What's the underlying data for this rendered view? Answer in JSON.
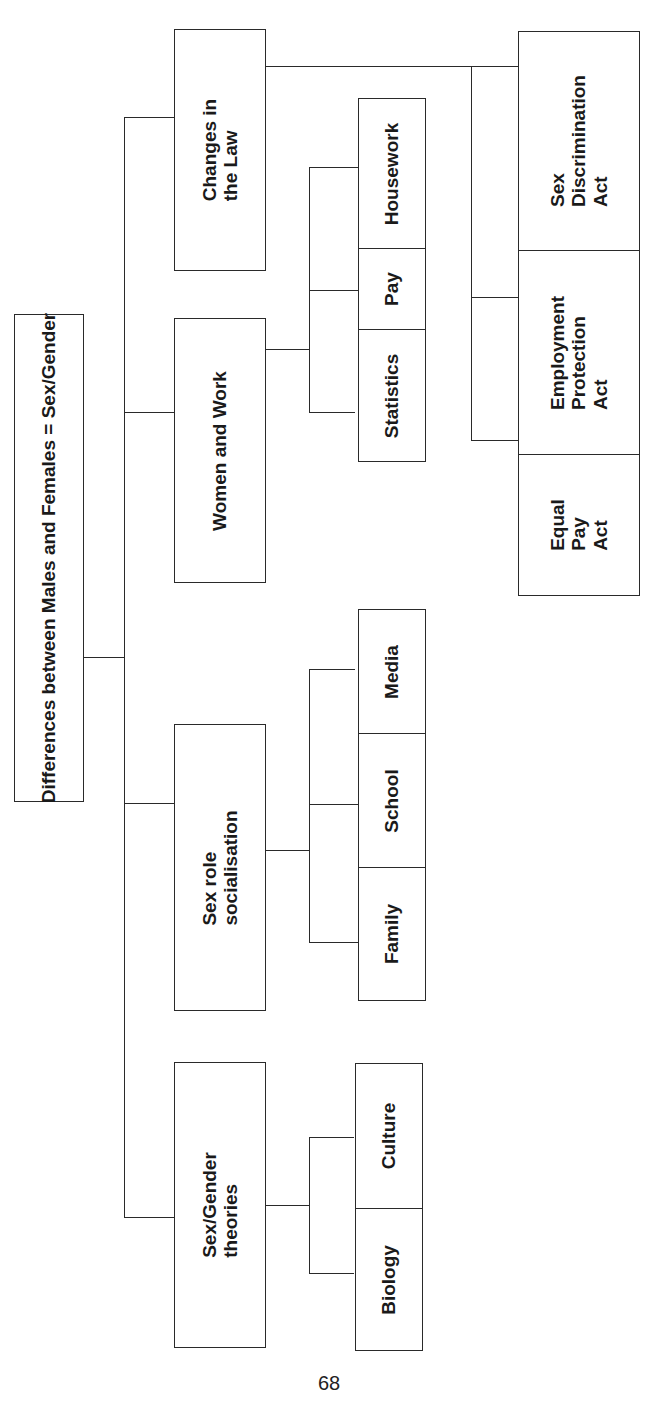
{
  "diagram": {
    "orientation": "rotated -90deg (reads bottom-to-top)",
    "root": {
      "label": "Differences between Males and Females = Sex/Gender"
    },
    "branches": [
      {
        "label": "Sex/Gender\ntheories",
        "children": [
          {
            "label": "Biology"
          },
          {
            "label": "Culture"
          }
        ]
      },
      {
        "label": "Sex role\nsocialisation",
        "children": [
          {
            "label": "Family"
          },
          {
            "label": "School"
          },
          {
            "label": "Media"
          }
        ]
      },
      {
        "label": "Women and Work",
        "children": [
          {
            "label": "Statistics"
          },
          {
            "label": "Pay"
          },
          {
            "label": "Housework"
          }
        ]
      },
      {
        "label": "Changes in\nthe Law",
        "children": [
          {
            "label": "Equal\nPay\nAct"
          },
          {
            "label": "Employment\nProtection\nAct"
          },
          {
            "label": "Sex\nDiscrimination\nAct"
          }
        ]
      }
    ]
  },
  "page": {
    "number": "68"
  }
}
